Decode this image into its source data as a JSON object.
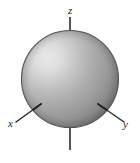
{
  "figure": {
    "name": "s-orbital-sphere-diagram",
    "background_color": "#ffffff"
  },
  "sphere": {
    "center_x": 70,
    "center_y": 79,
    "radius": 49,
    "outline_color": "#4a4a4a",
    "highlight_color": "#e2e2e2",
    "mid_color": "#a8a8a8",
    "shadow_color": "#6f6f6f",
    "highlight_x": 46,
    "highlight_y": 57
  },
  "axes": {
    "line_color": "#2b2b2b",
    "items": [
      {
        "id": "z",
        "label": "z",
        "label_x": 68,
        "label_y": 14,
        "x1": 70,
        "y1": 17,
        "x2": 70,
        "y2": 150
      },
      {
        "id": "x",
        "label": "x",
        "label_x": 8,
        "label_y": 127,
        "x1": 16,
        "y1": 122,
        "x2": 41,
        "y2": 104
      },
      {
        "id": "y",
        "label": "y",
        "label_x": 123,
        "label_y": 128,
        "x1": 98,
        "y1": 104,
        "x2": 124,
        "y2": 122
      }
    ]
  }
}
